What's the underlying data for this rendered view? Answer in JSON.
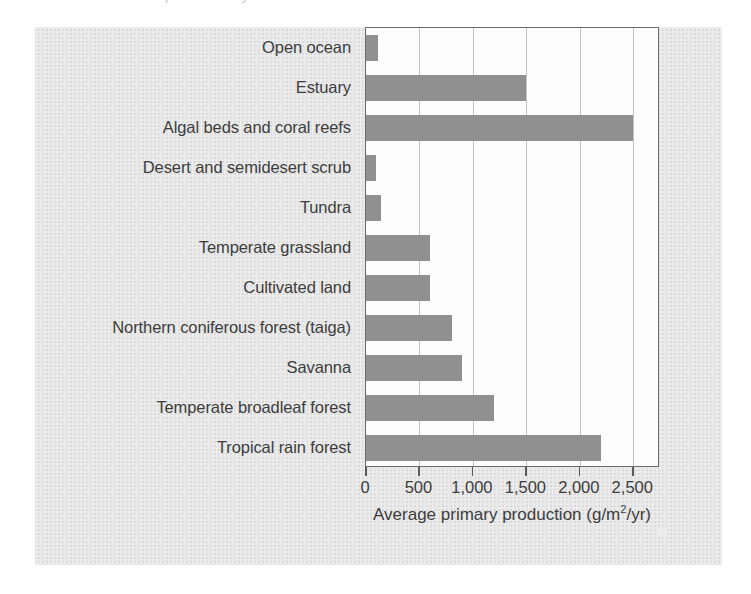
{
  "page": {
    "top_cut_text": "and aquatic ecosystems",
    "background_color": "#ffffff",
    "panel_color": "#e9e9e9"
  },
  "chart_data": {
    "type": "bar",
    "orientation": "horizontal",
    "title": "",
    "subtitle": "",
    "xlabel": "Average primary production (g/m2/yr)",
    "xlabel_display": "Average primary production (g/m",
    "xlabel_sup": "2",
    "xlabel_tail": "/yr)",
    "ylabel": "",
    "categories": [
      "Open ocean",
      "Estuary",
      "Algal beds and coral reefs",
      "Desert and semidesert scrub",
      "Tundra",
      "Temperate grassland",
      "Cultivated land",
      "Northern coniferous forest (taiga)",
      "Savanna",
      "Temperate broadleaf forest",
      "Tropical rain forest"
    ],
    "values": [
      110,
      1500,
      2500,
      90,
      140,
      600,
      600,
      800,
      900,
      1200,
      2200
    ],
    "xlim": [
      0,
      2750
    ],
    "xticks": [
      0,
      500,
      1000,
      1500,
      2000,
      2500
    ],
    "xtick_labels": [
      "0",
      "500",
      "1,000",
      "1,500",
      "2,000",
      "2,500"
    ],
    "grid": true,
    "grid_axis": "x",
    "legend": false,
    "bar_color": "#909090",
    "plot_background": "#fdfdfd",
    "axis_color": "#6a6a6a",
    "gridline_color": "#c4c4c4",
    "text_color": "#3d3d3d"
  }
}
